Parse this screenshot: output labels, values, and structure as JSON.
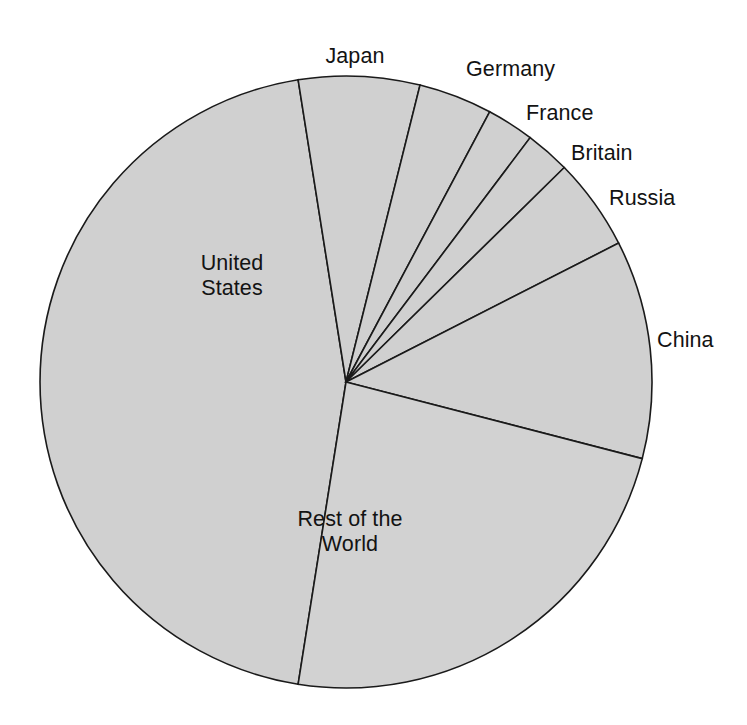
{
  "chart_data": {
    "type": "pie",
    "title": "",
    "subtitle": "",
    "xlabel": "",
    "ylabel": "",
    "grid": false,
    "legend_position": "none",
    "label_style": "outside-and-inside-callout-free",
    "start_angle_deg_clockwise_from_north": 189,
    "fill_color": "#d0d0d0",
    "stroke_color": "#1a1a1a",
    "background_color": "#ffffff",
    "categories": [
      "United States",
      "Japan",
      "Germany",
      "France",
      "Britain",
      "Russia",
      "China",
      "Rest of the World"
    ],
    "values": [
      45.0,
      6.4,
      3.9,
      2.5,
      2.4,
      4.9,
      11.5,
      23.4
    ],
    "angles_deg": [
      162.0,
      23.0,
      14.0,
      9.0,
      8.5,
      17.5,
      41.5,
      84.5
    ],
    "slices": [
      {
        "label": "United States",
        "value": 45.0,
        "angle_deg": 162.0,
        "start_deg": 189.0,
        "end_deg": 351.0,
        "fill": "#d0d0d0",
        "label_placement": "inside"
      },
      {
        "label": "Japan",
        "value": 6.4,
        "angle_deg": 23.0,
        "start_deg": 351.0,
        "end_deg": 14.0,
        "fill": "#d0d0d0",
        "label_placement": "outside"
      },
      {
        "label": "Germany",
        "value": 3.9,
        "angle_deg": 14.0,
        "start_deg": 14.0,
        "end_deg": 28.0,
        "fill": "#d0d0d0",
        "label_placement": "outside"
      },
      {
        "label": "France",
        "value": 2.5,
        "angle_deg": 9.0,
        "start_deg": 28.0,
        "end_deg": 37.0,
        "fill": "#d0d0d0",
        "label_placement": "outside"
      },
      {
        "label": "Britain",
        "value": 2.4,
        "angle_deg": 8.5,
        "start_deg": 37.0,
        "end_deg": 45.5,
        "fill": "#d0d0d0",
        "label_placement": "outside"
      },
      {
        "label": "Russia",
        "value": 4.9,
        "angle_deg": 17.5,
        "start_deg": 45.5,
        "end_deg": 63.0,
        "fill": "#d0d0d0",
        "label_placement": "outside"
      },
      {
        "label": "China",
        "value": 11.5,
        "angle_deg": 41.5,
        "start_deg": 63.0,
        "end_deg": 104.5,
        "fill": "#d0d0d0",
        "label_placement": "outside"
      },
      {
        "label": "Rest of the World",
        "value": 23.4,
        "angle_deg": 84.5,
        "start_deg": 104.5,
        "end_deg": 189.0,
        "fill": "#d2d2d2",
        "label_placement": "inside"
      }
    ]
  },
  "labels": {
    "japan": "Japan",
    "germany": "Germany",
    "france": "France",
    "britain": "Britain",
    "russia": "Russia",
    "china": "China",
    "united_states_line1": "United",
    "united_states_line2": "States",
    "rest_line1": "Rest of the",
    "rest_line2": "World"
  },
  "geometry": {
    "center_x": 346,
    "center_y": 382,
    "radius": 306
  }
}
